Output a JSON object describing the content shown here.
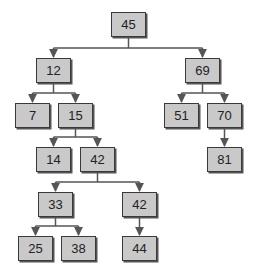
{
  "title": "",
  "tree": {
    "type": "binary-search-tree",
    "style": {
      "node_fill": "#c9c9c9",
      "node_border": "#3a3a3a",
      "edge_color": "#555555",
      "background": "#ffffff"
    },
    "nodes": [
      {
        "id": "n45",
        "label": "45",
        "x": 111,
        "y": 12,
        "parent": null
      },
      {
        "id": "n12",
        "label": "12",
        "x": 36,
        "y": 58,
        "parent": "n45"
      },
      {
        "id": "n69",
        "label": "69",
        "x": 185,
        "y": 58,
        "parent": "n45"
      },
      {
        "id": "n7",
        "label": "7",
        "x": 15,
        "y": 103,
        "parent": "n12"
      },
      {
        "id": "n15",
        "label": "15",
        "x": 58,
        "y": 103,
        "parent": "n12"
      },
      {
        "id": "n51",
        "label": "51",
        "x": 164,
        "y": 103,
        "parent": "n69"
      },
      {
        "id": "n70",
        "label": "70",
        "x": 207,
        "y": 103,
        "parent": "n69"
      },
      {
        "id": "n14",
        "label": "14",
        "x": 36,
        "y": 147,
        "parent": "n15"
      },
      {
        "id": "n42a",
        "label": "42",
        "x": 80,
        "y": 147,
        "parent": "n15"
      },
      {
        "id": "n81",
        "label": "81",
        "x": 207,
        "y": 147,
        "parent": "n70"
      },
      {
        "id": "n33",
        "label": "33",
        "x": 38,
        "y": 192,
        "parent": "n42a"
      },
      {
        "id": "n42b",
        "label": "42",
        "x": 122,
        "y": 192,
        "parent": "n42a"
      },
      {
        "id": "n25",
        "label": "25",
        "x": 18,
        "y": 236,
        "parent": "n33"
      },
      {
        "id": "n38",
        "label": "38",
        "x": 61,
        "y": 236,
        "parent": "n33"
      },
      {
        "id": "n44",
        "label": "44",
        "x": 122,
        "y": 236,
        "parent": "n42b"
      }
    ]
  }
}
